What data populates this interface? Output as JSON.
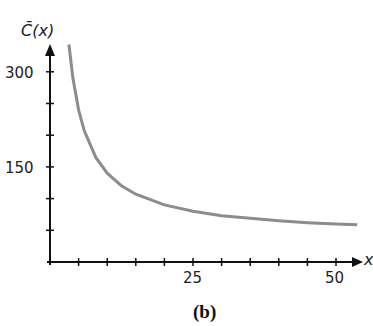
{
  "chart_data": {
    "type": "line",
    "title": "",
    "caption": "(b)",
    "xlabel": "x",
    "ylabel": "C̄(x)",
    "xlim": [
      0,
      54
    ],
    "ylim": [
      0,
      340
    ],
    "x_ticks": [
      5,
      10,
      15,
      20,
      25,
      30,
      35,
      40,
      45,
      50
    ],
    "x_tick_labels": {
      "25": "25",
      "50": "50"
    },
    "y_ticks": [
      50,
      100,
      150,
      200,
      250,
      300
    ],
    "y_tick_labels": {
      "150": "150",
      "300": "300"
    },
    "grid": false,
    "legend": null,
    "series": [
      {
        "name": "C̄(x)",
        "color": "#8c8c8c",
        "x": [
          3.3,
          4,
          5,
          6,
          8,
          10,
          12.5,
          15,
          20,
          25,
          30,
          35,
          40,
          45,
          50,
          53.7
        ],
        "y": [
          343,
          290,
          240,
          207,
          165,
          140,
          120,
          107,
          90,
          80,
          73,
          69,
          65,
          62,
          60,
          58.6
        ]
      }
    ]
  },
  "labels": {
    "y_axis": "C̄(x)",
    "x_axis": "x",
    "y_300": "300",
    "y_150": "150",
    "x_25": "25",
    "x_50": "50",
    "caption": "(b)"
  }
}
